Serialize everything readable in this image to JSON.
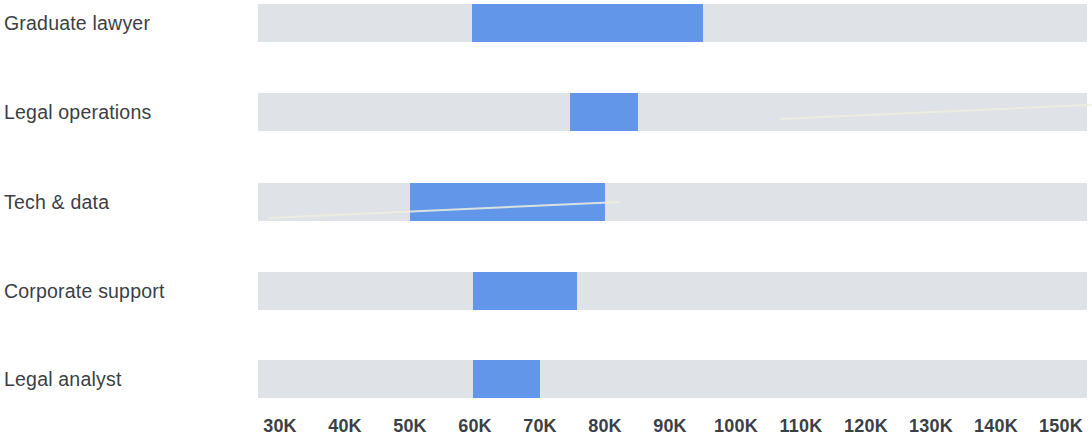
{
  "chart_data": {
    "type": "bar",
    "subtype": "range-bar",
    "title": "",
    "subtitle": "",
    "xlabel": "",
    "ylabel": "",
    "categories": [
      "Graduate lawyer",
      "Legal operations",
      "Tech & data",
      "Corporate support",
      "Legal analyst"
    ],
    "series": [
      {
        "name": "Salary range",
        "type": "range",
        "color": "#6296e8",
        "values": [
          {
            "category": "Graduate lawyer",
            "low": 59500,
            "high": 95000,
            "low_label": "59.5K",
            "high_label": "95K"
          },
          {
            "category": "Legal operations",
            "low": 74500,
            "high": 85000,
            "low_label": "74.5K",
            "high_label": "85K"
          },
          {
            "category": "Tech & data",
            "low": 50000,
            "high": 80000,
            "low_label": "50K",
            "high_label": "80K"
          },
          {
            "category": "Corporate support",
            "low": 59500,
            "high": 75500,
            "low_label": "59.5K",
            "high_label": "75.5K"
          },
          {
            "category": "Legal analyst",
            "low": 59500,
            "high": 70000,
            "low_label": "59.5K",
            "high_label": "70K"
          }
        ]
      }
    ],
    "track": {
      "name": "Full scale",
      "color": "#dfe3e7",
      "min": 26800,
      "max": 154000
    },
    "xlim": [
      26800,
      154000
    ],
    "ticks": [
      30000,
      40000,
      50000,
      60000,
      70000,
      80000,
      90000,
      100000,
      110000,
      120000,
      130000,
      140000,
      150000
    ],
    "tick_labels": [
      "30K",
      "40K",
      "50K",
      "60K",
      "70K",
      "80K",
      "90K",
      "100K",
      "110K",
      "120K",
      "130K",
      "140K",
      "150K"
    ],
    "grid": false,
    "legend": null,
    "annotations": []
  },
  "colors": {
    "bar": "#6296e8",
    "track": "#dfe3e7",
    "text": "#3b3f45",
    "background": "#ffffff"
  },
  "rows": [
    {
      "label": "Graduate lawyer",
      "bar_left_px": 472,
      "bar_width_px": 231
    },
    {
      "label": "Legal operations",
      "bar_left_px": 570,
      "bar_width_px": 68
    },
    {
      "label": "Tech & data",
      "bar_left_px": 410,
      "bar_width_px": 195
    },
    {
      "label": "Corporate support",
      "bar_left_px": 473,
      "bar_width_px": 104
    },
    {
      "label": "Legal analyst",
      "bar_left_px": 473,
      "bar_width_px": 67
    }
  ],
  "axis": {
    "labels": [
      {
        "text": "30K",
        "x_px": 280
      },
      {
        "text": "40K",
        "x_px": 345
      },
      {
        "text": "50K",
        "x_px": 410
      },
      {
        "text": "60K",
        "x_px": 475
      },
      {
        "text": "70K",
        "x_px": 540
      },
      {
        "text": "80K",
        "x_px": 605
      },
      {
        "text": "90K",
        "x_px": 670
      },
      {
        "text": "100K",
        "x_px": 736
      },
      {
        "text": "110K",
        "x_px": 801
      },
      {
        "text": "120K",
        "x_px": 866
      },
      {
        "text": "130K",
        "x_px": 931
      },
      {
        "text": "140K",
        "x_px": 996
      },
      {
        "text": "150K",
        "x_px": 1061
      }
    ]
  }
}
